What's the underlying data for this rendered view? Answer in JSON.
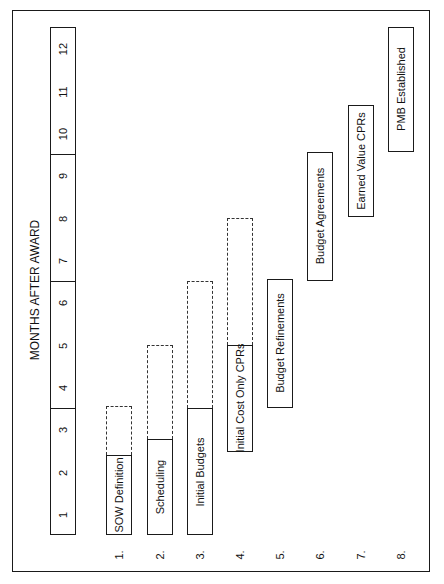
{
  "diagram": {
    "title": "MONTHS AFTER AWARD",
    "orientation": "rotated-90-ccw",
    "months": [
      "1",
      "2",
      "3",
      "4",
      "5",
      "6",
      "7",
      "8",
      "9",
      "10",
      "11",
      "12"
    ],
    "month_groups": [
      {
        "from": 1,
        "to": 3
      },
      {
        "from": 4,
        "to": 6
      },
      {
        "from": 7,
        "to": 9
      },
      {
        "from": 10,
        "to": 12
      }
    ],
    "rows": [
      {
        "num": "1.",
        "label": "SOW Definition",
        "solid_start": 0,
        "solid_end": 1.9,
        "dashed_end": 3.05
      },
      {
        "num": "2.",
        "label": "Scheduling",
        "solid_start": 0,
        "solid_end": 2.27,
        "dashed_end": 4.5
      },
      {
        "num": "3.",
        "label": "Initial Budgets",
        "solid_start": 0,
        "solid_end": 3.0,
        "dashed_end": 6.0
      },
      {
        "num": "4.",
        "label": "Initial Cost Only CPRs",
        "solid_start": 1.95,
        "solid_end": 4.5,
        "dashed_end": 7.5
      },
      {
        "num": "5.",
        "label": "Budget Refinements",
        "solid_start": 3.0,
        "solid_end": 6.05
      },
      {
        "num": "6.",
        "label": "Budget Agreements",
        "solid_start": 6.0,
        "solid_end": 9.05
      },
      {
        "num": "7.",
        "label": "Earned Value CPRs",
        "solid_start": 7.5,
        "solid_end": 10.15
      },
      {
        "num": "8.",
        "label": "PMB Established",
        "solid_start": 9.05,
        "solid_end": 12.0
      }
    ]
  }
}
